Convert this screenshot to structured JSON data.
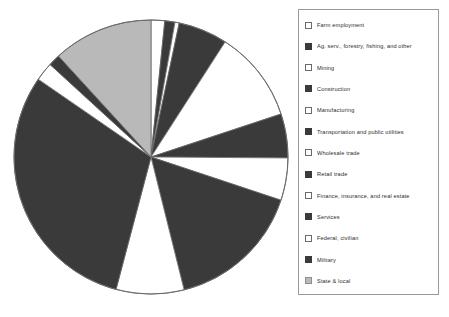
{
  "chart_data": {
    "type": "pie",
    "title": "",
    "xlabel": "",
    "ylabel": "",
    "legend_position": "right",
    "grid": false,
    "center": {
      "x": 151,
      "y": 157
    },
    "radius": 137,
    "start_angle_deg": -90,
    "direction": "clockwise",
    "categories": [
      "Farm employment",
      "Ag. serv., forestry, fishing, and other",
      "Mining",
      "Construction",
      "Manufacturing",
      "Transportation and public utilities",
      "Wholesale trade",
      "Retail trade",
      "Finance, insurance, and real estate",
      "Services",
      "Federal, civilian",
      "Military",
      "State & local"
    ],
    "values": [
      1.6,
      1.2,
      0.5,
      5.8,
      10.8,
      5.2,
      5.0,
      16.0,
      8.0,
      30.5,
      2.2,
      1.4,
      11.8
    ],
    "slices": [
      {
        "label": "Farm employment",
        "value": 1.6,
        "fill": "white",
        "start_deg": -90.0,
        "end_deg": -84.2
      },
      {
        "label": "Ag. serv., forestry, fishing, and other",
        "value": 1.2,
        "fill": "dark",
        "start_deg": -84.2,
        "end_deg": -79.9
      },
      {
        "label": "Mining",
        "value": 0.5,
        "fill": "white",
        "start_deg": -79.9,
        "end_deg": -78.1
      },
      {
        "label": "Construction",
        "value": 5.8,
        "fill": "dark",
        "start_deg": -78.1,
        "end_deg": -57.2
      },
      {
        "label": "Manufacturing",
        "value": 10.8,
        "fill": "white",
        "start_deg": -57.2,
        "end_deg": -18.3
      },
      {
        "label": "Transportation and public utilities",
        "value": 5.2,
        "fill": "dark",
        "start_deg": -18.3,
        "end_deg": 0.4
      },
      {
        "label": "Wholesale trade",
        "value": 5.0,
        "fill": "white",
        "start_deg": 0.4,
        "end_deg": 18.4
      },
      {
        "label": "Retail trade",
        "value": 16.0,
        "fill": "dark",
        "start_deg": 18.4,
        "end_deg": 76.0
      },
      {
        "label": "Finance, insurance, and real estate",
        "value": 8.0,
        "fill": "white",
        "start_deg": 76.0,
        "end_deg": 104.8
      },
      {
        "label": "Services",
        "value": 30.5,
        "fill": "dark",
        "start_deg": 104.8,
        "end_deg": 214.6
      },
      {
        "label": "Federal, civilian",
        "value": 2.2,
        "fill": "white",
        "start_deg": 214.6,
        "end_deg": 222.5
      },
      {
        "label": "Military",
        "value": 1.4,
        "fill": "dark",
        "start_deg": 222.5,
        "end_deg": 227.5
      },
      {
        "label": "State & local",
        "value": 11.8,
        "fill": "gray",
        "start_deg": 227.5,
        "end_deg": 270.0
      }
    ],
    "colors": {
      "white": "#ffffff",
      "dark": "#3a3a3a",
      "gray": "#b9b9b9",
      "outline": "#6a6a6a"
    }
  },
  "legend": {
    "items": [
      {
        "label": "Farm employment",
        "fill": "white"
      },
      {
        "label": "Ag. serv., forestry, fishing, and other",
        "fill": "dark"
      },
      {
        "label": "Mining",
        "fill": "white"
      },
      {
        "label": "Construction",
        "fill": "dark"
      },
      {
        "label": "Manufacturing",
        "fill": "white"
      },
      {
        "label": "Transportation and public utilities",
        "fill": "dark"
      },
      {
        "label": "Wholesale trade",
        "fill": "white"
      },
      {
        "label": "Retail trade",
        "fill": "dark"
      },
      {
        "label": "Finance, insurance, and real estate",
        "fill": "white"
      },
      {
        "label": "Services",
        "fill": "dark"
      },
      {
        "label": "Federal, civilian",
        "fill": "white"
      },
      {
        "label": "Military",
        "fill": "dark"
      },
      {
        "label": "State & local",
        "fill": "gray"
      }
    ]
  },
  "caption": ""
}
